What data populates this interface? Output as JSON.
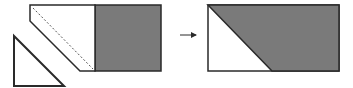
{
  "diagram": {
    "colors": {
      "fill_gray": "#7a7a7a",
      "stroke": "#2a2a2a",
      "background": "#ffffff",
      "white_fill": "#ffffff"
    },
    "left_figure": {
      "white_polygon": "30,5 95,5 95,71 80,71 30,21",
      "gray_rect": {
        "x": 95,
        "y": 5,
        "w": 66,
        "h": 66
      },
      "dashed_line": {
        "x1": 33,
        "y1": 8,
        "x2": 93,
        "y2": 69
      },
      "detached_triangle": "14,36 14,86 64,86"
    },
    "arrow": {
      "x1": 180,
      "y1": 35,
      "x2": 196,
      "y2": 35
    },
    "right_figure": {
      "outer_rect": {
        "x": 208,
        "y": 5,
        "w": 131,
        "h": 66
      },
      "gray_polygon": "208,5 339,5 339,71 272,71"
    }
  }
}
